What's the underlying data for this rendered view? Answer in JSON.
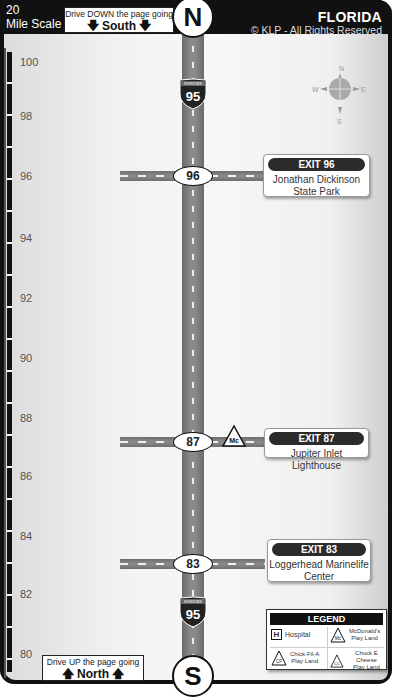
{
  "header": {
    "scale_label_line1": "20",
    "scale_label_line2": "Mile Scale",
    "south_direction": {
      "line1": "Drive DOWN the page going",
      "line2": "South"
    },
    "north_marker": "N",
    "title": "FLORIDA",
    "copyright": "© KLP - All Rights Reserved"
  },
  "compass": {
    "n": "N",
    "s": "S",
    "e": "E",
    "w": "W"
  },
  "highway": {
    "shield_top_label": "INTERSTATE",
    "route_number": "95"
  },
  "mile_scale": {
    "ticks": [
      {
        "label": "100",
        "y": 56
      },
      {
        "label": "98",
        "y": 110
      },
      {
        "label": "96",
        "y": 170
      },
      {
        "label": "94",
        "y": 232
      },
      {
        "label": "92",
        "y": 292
      },
      {
        "label": "90",
        "y": 352
      },
      {
        "label": "88",
        "y": 412
      },
      {
        "label": "86",
        "y": 470
      },
      {
        "label": "84",
        "y": 530
      },
      {
        "label": "82",
        "y": 588
      },
      {
        "label": "80",
        "y": 648
      }
    ]
  },
  "exits": [
    {
      "number": "96",
      "tag": "EXIT 96",
      "name_line1": "Jonathan Dickinson",
      "name_line2": "State Park",
      "amenity": ""
    },
    {
      "number": "87",
      "tag": "EXIT 87",
      "name_line1": "Jupiter Inlet Lighthouse",
      "name_line2": "",
      "amenity": "Mc"
    },
    {
      "number": "83",
      "tag": "EXIT 83",
      "name_line1": "Loggerhead Marinelife",
      "name_line2": "Center",
      "amenity": ""
    }
  ],
  "footer": {
    "north_direction": {
      "line1": "Drive UP the page going",
      "line2": "North"
    },
    "south_marker": "S"
  },
  "legend": {
    "title": "LEGEND",
    "items": [
      {
        "symbol": "H",
        "label": "Hospital"
      },
      {
        "symbol": "Mc",
        "label_line1": "McDonald's",
        "label_line2": "Play Land"
      },
      {
        "symbol": "CF",
        "label_line1": "Chick-Fil-A",
        "label_line2": "Play Land"
      },
      {
        "symbol": "CC",
        "label_line1": "Chuck E Cheese",
        "label_line2": "Play Land"
      }
    ]
  },
  "colors": {
    "frame": "#111111",
    "road": "#7a7a7a",
    "panel": "#f2f2f2"
  }
}
